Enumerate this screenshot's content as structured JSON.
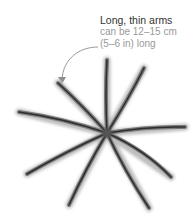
{
  "annotation": {
    "title": "Long, thin arms",
    "line1": "can be 12–15 cm",
    "line2": "(5–6 in) long"
  },
  "illustration": {
    "subject": "starfish-with-nine-long-thin-arms",
    "arm_count": 9,
    "colors": {
      "arm_dark": "#2e2e2e",
      "arm_mid": "#7a7a7a",
      "arm_light": "#bdbdbd",
      "arrow": "#8c8c8c",
      "title_text": "#333333",
      "body_text": "#9a9a9a"
    }
  }
}
